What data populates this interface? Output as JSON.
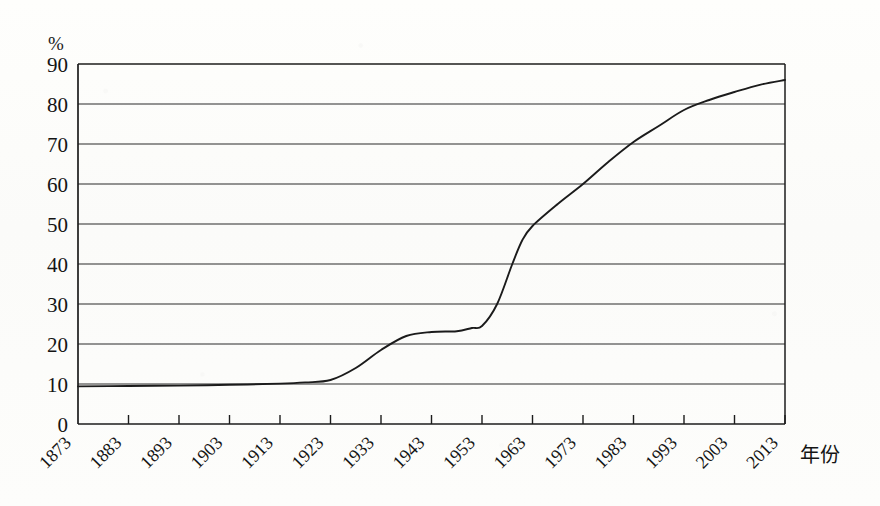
{
  "chart_data": {
    "type": "line",
    "title": "",
    "subtitle": "",
    "xlabel": "年份",
    "ylabel": "%",
    "unit_label": "%",
    "x": [
      1873,
      1883,
      1893,
      1903,
      1913,
      1923,
      1933,
      1943,
      1953,
      1963,
      1973,
      1983,
      1993,
      2003,
      2013
    ],
    "xtick_labels": [
      "1873",
      "1883",
      "1893",
      "1903",
      "1913",
      "1923",
      "1933",
      "1943",
      "1953",
      "1963",
      "1973",
      "1983",
      "1993",
      "2003",
      "2013"
    ],
    "ytick_labels": [
      "0",
      "10",
      "20",
      "30",
      "40",
      "50",
      "60",
      "70",
      "80",
      "90"
    ],
    "ytick_values": [
      0,
      10,
      20,
      30,
      40,
      50,
      60,
      70,
      80,
      90
    ],
    "ylim": [
      0,
      90
    ],
    "xlim": [
      1873,
      2013
    ],
    "grid": "horizontal",
    "legend": "none",
    "series": [
      {
        "name": "城市化率",
        "values": [
          9.4,
          9.5,
          9.6,
          9.8,
          10.1,
          11.0,
          18.5,
          23.0,
          24.5,
          49.5,
          60.0,
          70.5,
          78.5,
          83.0,
          86.0
        ],
        "points": [
          {
            "year": 1873,
            "value": 9.4
          },
          {
            "year": 1883,
            "value": 9.5
          },
          {
            "year": 1893,
            "value": 9.6
          },
          {
            "year": 1903,
            "value": 9.8
          },
          {
            "year": 1913,
            "value": 10.1
          },
          {
            "year": 1918,
            "value": 10.4
          },
          {
            "year": 1923,
            "value": 11.0
          },
          {
            "year": 1928,
            "value": 14.0
          },
          {
            "year": 1933,
            "value": 18.5
          },
          {
            "year": 1938,
            "value": 22.0
          },
          {
            "year": 1943,
            "value": 23.0
          },
          {
            "year": 1948,
            "value": 23.2
          },
          {
            "year": 1951,
            "value": 24.0
          },
          {
            "year": 1953,
            "value": 24.5
          },
          {
            "year": 1956,
            "value": 30.0
          },
          {
            "year": 1959,
            "value": 40.0
          },
          {
            "year": 1961,
            "value": 46.0
          },
          {
            "year": 1963,
            "value": 49.5
          },
          {
            "year": 1968,
            "value": 55.0
          },
          {
            "year": 1973,
            "value": 60.0
          },
          {
            "year": 1978,
            "value": 65.5
          },
          {
            "year": 1983,
            "value": 70.5
          },
          {
            "year": 1988,
            "value": 74.5
          },
          {
            "year": 1993,
            "value": 78.5
          },
          {
            "year": 1998,
            "value": 81.0
          },
          {
            "year": 2003,
            "value": 83.0
          },
          {
            "year": 2008,
            "value": 84.8
          },
          {
            "year": 2013,
            "value": 86.0
          }
        ]
      }
    ],
    "annotations": []
  },
  "figure": {
    "unit_marker": "%",
    "x_axis_title": "年份"
  }
}
